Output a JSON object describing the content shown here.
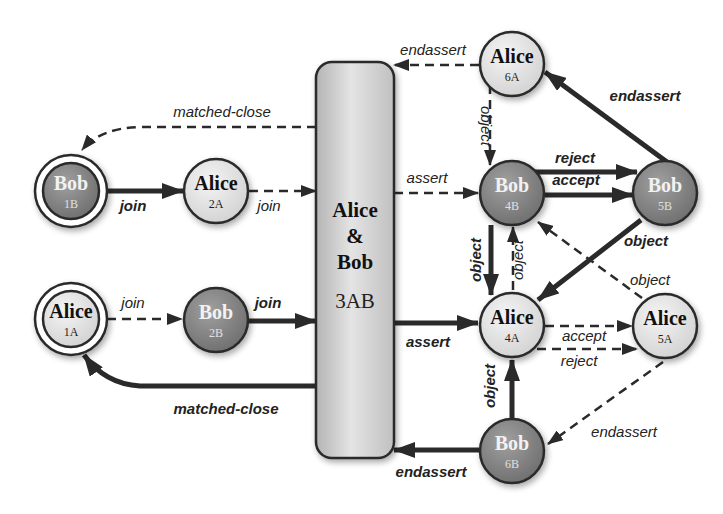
{
  "diagram": {
    "colors": {
      "alice_fill": "#e6e6e6",
      "bob_fill": "#8a8a8a",
      "stroke": "#2a2a2a",
      "box_fill": "#cfcfcf",
      "bob_text": "#f2f2f2",
      "alice_text": "#111111"
    },
    "nodes": {
      "n1B": {
        "name": "Bob",
        "id": "1B",
        "role": "bob",
        "initial": true
      },
      "n2A": {
        "name": "Alice",
        "id": "2A",
        "role": "alice"
      },
      "n1A": {
        "name": "Alice",
        "id": "1A",
        "role": "alice",
        "initial": true
      },
      "n2B": {
        "name": "Bob",
        "id": "2B",
        "role": "bob"
      },
      "n6A": {
        "name": "Alice",
        "id": "6A",
        "role": "alice"
      },
      "n4B": {
        "name": "Bob",
        "id": "4B",
        "role": "bob"
      },
      "n5B": {
        "name": "Bob",
        "id": "5B",
        "role": "bob"
      },
      "n4A": {
        "name": "Alice",
        "id": "4A",
        "role": "alice"
      },
      "n5A": {
        "name": "Alice",
        "id": "5A",
        "role": "alice"
      },
      "n6B": {
        "name": "Bob",
        "id": "6B",
        "role": "bob"
      }
    },
    "shared_box": {
      "line1": "Alice",
      "line2": "&",
      "line3": "Bob",
      "id": "3AB"
    },
    "edges": {
      "e_matched_close_top": {
        "label": "matched-close",
        "from": "3AB",
        "to": "1B",
        "style": "dashed"
      },
      "e_join_1B_2A": {
        "label": "join",
        "from": "1B",
        "to": "2A",
        "style": "solid"
      },
      "e_join_2A_3AB": {
        "label": "join",
        "from": "2A",
        "to": "3AB",
        "style": "dashed"
      },
      "e_join_1A_2B": {
        "label": "join",
        "from": "1A",
        "to": "2B",
        "style": "dashed"
      },
      "e_join_2B_3AB": {
        "label": "join",
        "from": "2B",
        "to": "3AB",
        "style": "solid"
      },
      "e_matched_close_bottom": {
        "label": "matched-close",
        "from": "3AB",
        "to": "1A",
        "style": "solid"
      },
      "e_endassert_6A_3AB": {
        "label": "endassert",
        "from": "6A",
        "to": "3AB",
        "style": "dashed"
      },
      "e_assert_3AB_4B": {
        "label": "assert",
        "from": "3AB",
        "to": "4B",
        "style": "dashed"
      },
      "e_assert_3AB_4A": {
        "label": "assert",
        "from": "3AB",
        "to": "4A",
        "style": "solid"
      },
      "e_endassert_6B_3AB": {
        "label": "endassert",
        "from": "6B",
        "to": "3AB",
        "style": "solid"
      },
      "e_object_6A_4B": {
        "label": "object",
        "from": "6A",
        "to": "4B",
        "style": "dashed"
      },
      "e_reject_4B_5B": {
        "label": "reject",
        "from": "4B",
        "to": "5B",
        "style": "solid"
      },
      "e_accept_4B_5B": {
        "label": "accept",
        "from": "4B",
        "to": "5B",
        "style": "solid"
      },
      "e_endassert_5B_6A": {
        "label": "endassert",
        "from": "5B",
        "to": "6A",
        "style": "solid"
      },
      "e_object_4B_4A": {
        "label": "object",
        "from": "4B",
        "to": "4A",
        "style": "solid"
      },
      "e_object_4A_4B": {
        "label": "object",
        "from": "4A",
        "to": "4B",
        "style": "dashed"
      },
      "e_object_5B_4A": {
        "label": "object",
        "from": "5B",
        "to": "4A",
        "style": "solid"
      },
      "e_object_5A_4B": {
        "label": "object",
        "from": "5A",
        "to": "4B",
        "style": "dashed"
      },
      "e_accept_4A_5A": {
        "label": "accept",
        "from": "4A",
        "to": "5A",
        "style": "dashed"
      },
      "e_reject_4A_5A": {
        "label": "reject",
        "from": "4A",
        "to": "5A",
        "style": "dashed"
      },
      "e_object_6B_4A": {
        "label": "object",
        "from": "6B",
        "to": "4A",
        "style": "solid"
      },
      "e_endassert_5A_6B": {
        "label": "endassert",
        "from": "5A",
        "to": "6B",
        "style": "dashed"
      }
    }
  }
}
